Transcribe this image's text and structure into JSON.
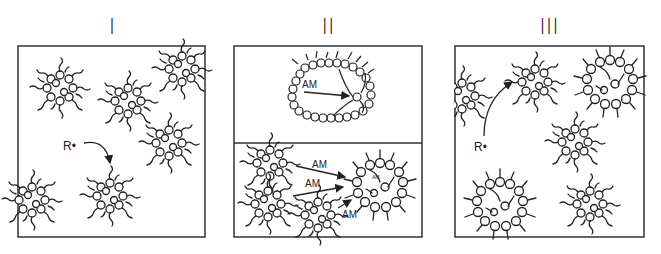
{
  "panels": [
    {
      "label": "I",
      "annotations": {
        "radical": "R•"
      }
    },
    {
      "label": "II",
      "annotations": {
        "top_arrow": "AM",
        "bottom_arrows": [
          "AM",
          "AM",
          "AM"
        ],
        "inner_small": "AM"
      }
    },
    {
      "label": "III",
      "annotations": {
        "radical": "R•"
      }
    }
  ],
  "colors": {
    "stroke": "#222222",
    "background": "#ffffff"
  }
}
